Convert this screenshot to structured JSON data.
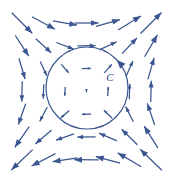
{
  "figure": {
    "width": 172,
    "height": 182,
    "background": "#ffffff"
  },
  "style": {
    "arrow_color": "#3a558f",
    "curve_color": "#3a558f",
    "label_color": "#2f4a85",
    "arrow_stroke_width": 1.25,
    "curve_stroke_width": 1.2
  },
  "curve": {
    "name": "C",
    "label": "C",
    "label_x": 110,
    "label_y": 78,
    "label_font_size": 11,
    "center_x": 87,
    "center_y": 88,
    "radius": 41,
    "orientation": "counterclockwise",
    "marker_angle_deg": 43
  },
  "chart_data": {
    "type": "quiver",
    "xlabel": "",
    "ylabel": "",
    "field_formula": "F(x,y) = <-y, x>",
    "field_center": [
      87,
      88
    ],
    "magnitude_scale": 0.46,
    "max_arrow_length": 30,
    "grid": {
      "cols": 7,
      "rows": 7,
      "x_start": 22,
      "y_start": 23,
      "x_step": 21.5,
      "y_step": 22.8
    },
    "legend": "none",
    "annotations": [
      {
        "text": "C",
        "x": 110,
        "y": 78
      }
    ],
    "arrows": [
      {
        "x": 22.0,
        "y": 23.0,
        "dx": 0.707,
        "dy": 0.707,
        "len": 29.0
      },
      {
        "x": 43.5,
        "y": 23.0,
        "dx": 0.879,
        "dy": 0.476,
        "len": 26.2
      },
      {
        "x": 65.0,
        "y": 23.0,
        "dx": 0.986,
        "dy": 0.166,
        "len": 24.5
      },
      {
        "x": 86.5,
        "y": 23.0,
        "dx": 1.0,
        "dy": 0.0,
        "len": 24.0
      },
      {
        "x": 108.0,
        "y": 23.0,
        "dx": 0.963,
        "dy": -0.269,
        "len": 24.8
      },
      {
        "x": 129.5,
        "y": 23.0,
        "dx": 0.851,
        "dy": -0.526,
        "len": 26.8
      },
      {
        "x": 151.0,
        "y": 23.0,
        "dx": 0.707,
        "dy": -0.707,
        "len": 29.8
      },
      {
        "x": 22.0,
        "y": 45.8,
        "dx": 0.547,
        "dy": 0.837,
        "len": 24.6
      },
      {
        "x": 43.5,
        "y": 45.8,
        "dx": 0.74,
        "dy": 0.673,
        "len": 20.9
      },
      {
        "x": 65.0,
        "y": 45.8,
        "dx": 0.934,
        "dy": 0.357,
        "len": 18.6
      },
      {
        "x": 86.5,
        "y": 45.8,
        "dx": 1.0,
        "dy": -0.012,
        "len": 18.0
      },
      {
        "x": 108.0,
        "y": 45.8,
        "dx": 0.907,
        "dy": -0.422,
        "len": 19.0
      },
      {
        "x": 129.5,
        "y": 45.8,
        "dx": 0.688,
        "dy": -0.726,
        "len": 21.6
      },
      {
        "x": 151.0,
        "y": 45.8,
        "dx": 0.505,
        "dy": -0.863,
        "len": 25.4
      },
      {
        "x": 22.0,
        "y": 68.6,
        "dx": 0.286,
        "dy": 0.958,
        "len": 21.6
      },
      {
        "x": 43.5,
        "y": 68.6,
        "dx": 0.409,
        "dy": 0.913,
        "len": 15.8
      },
      {
        "x": 65.0,
        "y": 68.6,
        "dx": 0.666,
        "dy": 0.746,
        "len": 11.3
      },
      {
        "x": 86.5,
        "y": 68.6,
        "dx": 1.0,
        "dy": -0.026,
        "len": 9.0
      },
      {
        "x": 108.0,
        "y": 68.6,
        "dx": 0.665,
        "dy": -0.747,
        "len": 11.5
      },
      {
        "x": 129.5,
        "y": 68.6,
        "dx": 0.403,
        "dy": -0.915,
        "len": 16.7
      },
      {
        "x": 151.0,
        "y": 68.6,
        "dx": 0.275,
        "dy": -0.961,
        "len": 22.4
      },
      {
        "x": 22.0,
        "y": 91.4,
        "dx": -0.026,
        "dy": 1.0,
        "len": 20.5
      },
      {
        "x": 43.5,
        "y": 91.4,
        "dx": -0.032,
        "dy": 0.999,
        "len": 14.5
      },
      {
        "x": 65.0,
        "y": 91.4,
        "dx": -0.063,
        "dy": 0.998,
        "len": 9.0
      },
      {
        "x": 86.5,
        "y": 91.4,
        "dx": 0.0,
        "dy": 1.0,
        "len": 1.8
      },
      {
        "x": 108.0,
        "y": 91.4,
        "dx": 0.059,
        "dy": -0.998,
        "len": 9.4
      },
      {
        "x": 129.5,
        "y": 91.4,
        "dx": 0.031,
        "dy": -0.999,
        "len": 15.5
      },
      {
        "x": 151.0,
        "y": 91.4,
        "dx": 0.026,
        "dy": -1.0,
        "len": 21.3
      },
      {
        "x": 22.0,
        "y": 114.2,
        "dx": -0.333,
        "dy": 0.943,
        "len": 22.0
      },
      {
        "x": 43.5,
        "y": 114.2,
        "dx": -0.466,
        "dy": 0.885,
        "len": 16.2
      },
      {
        "x": 65.0,
        "y": 114.2,
        "dx": -0.751,
        "dy": 0.661,
        "len": 11.4
      },
      {
        "x": 86.5,
        "y": 114.2,
        "dx": -1.0,
        "dy": 0.022,
        "len": 9.2
      },
      {
        "x": 108.0,
        "y": 114.2,
        "dx": -0.713,
        "dy": -0.701,
        "len": 11.6
      },
      {
        "x": 129.5,
        "y": 114.2,
        "dx": -0.452,
        "dy": -0.892,
        "len": 17.0
      },
      {
        "x": 151.0,
        "y": 114.2,
        "dx": -0.32,
        "dy": -0.947,
        "len": 22.8
      },
      {
        "x": 22.0,
        "y": 137.0,
        "dx": -0.574,
        "dy": 0.819,
        "len": 25.2
      },
      {
        "x": 43.5,
        "y": 137.0,
        "dx": -0.762,
        "dy": 0.648,
        "len": 21.3
      },
      {
        "x": 65.0,
        "y": 137.0,
        "dx": -0.942,
        "dy": 0.334,
        "len": 19.0
      },
      {
        "x": 86.5,
        "y": 137.0,
        "dx": -1.0,
        "dy": 0.01,
        "len": 18.4
      },
      {
        "x": 108.0,
        "y": 137.0,
        "dx": -0.917,
        "dy": -0.399,
        "len": 19.4
      },
      {
        "x": 129.5,
        "y": 137.0,
        "dx": -0.714,
        "dy": -0.7,
        "len": 22.0
      },
      {
        "x": 151.0,
        "y": 137.0,
        "dx": -0.53,
        "dy": -0.848,
        "len": 25.8
      },
      {
        "x": 22.0,
        "y": 159.8,
        "dx": -0.725,
        "dy": 0.689,
        "len": 29.4
      },
      {
        "x": 43.5,
        "y": 159.8,
        "dx": -0.889,
        "dy": 0.458,
        "len": 26.8
      },
      {
        "x": 65.0,
        "y": 159.8,
        "dx": -0.988,
        "dy": 0.151,
        "len": 25.0
      },
      {
        "x": 86.5,
        "y": 159.8,
        "dx": -1.0,
        "dy": -0.006,
        "len": 24.5
      },
      {
        "x": 108.0,
        "y": 159.8,
        "dx": -0.966,
        "dy": -0.257,
        "len": 25.2
      },
      {
        "x": 129.5,
        "y": 159.8,
        "dx": -0.861,
        "dy": -0.509,
        "len": 27.2
      },
      {
        "x": 151.0,
        "y": 159.8,
        "dx": -0.718,
        "dy": -0.696,
        "len": 30.2
      }
    ]
  }
}
